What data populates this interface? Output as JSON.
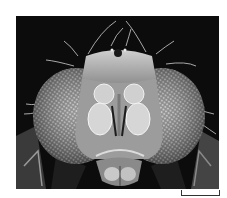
{
  "figure": {
    "background_color": "#0c0c0c",
    "page_color": "#ffffff"
  },
  "scale_bar": {
    "label": "",
    "color": "#333333"
  }
}
